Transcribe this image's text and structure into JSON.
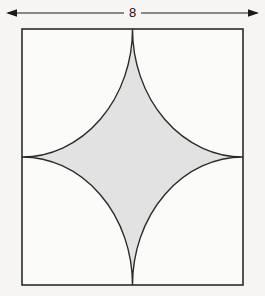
{
  "figure": {
    "background_color": "#f6f5f3",
    "dimension": {
      "label": "8",
      "orientation": "horizontal",
      "arrow_style": "double-headed",
      "line_color": "#1a1a1a",
      "x_start": 6,
      "x_end": 259,
      "y": 13
    },
    "square": {
      "name": "outer-square",
      "side_label": "8",
      "x": 22,
      "y": 29,
      "width": 221,
      "height": 256,
      "stroke_color": "#2b2b2b",
      "stroke_width": 1.6,
      "fill_color": "#fbfbfa"
    },
    "astroid": {
      "name": "astroid-star",
      "description": "Four-cusped star formed by four quarter-circle arcs centered at the square corners with radius equal to half the side",
      "fill_color": "#e2e2e2",
      "stroke_color": "#2b2b2b",
      "stroke_width": 1.4,
      "arc_radius": 110.5,
      "cusps": [
        {
          "name": "top-cusp",
          "x": 132.5,
          "y": 29
        },
        {
          "name": "right-cusp",
          "x": 243,
          "y": 157
        },
        {
          "name": "bottom-cusp",
          "x": 132.5,
          "y": 285
        },
        {
          "name": "left-cusp",
          "x": 22,
          "y": 157
        }
      ]
    }
  },
  "chart_data": {
    "type": "diagram",
    "labels": [
      "8"
    ],
    "annotations": [
      {
        "text": "8",
        "role": "side-length-dimension",
        "position": "top"
      }
    ],
    "shapes": [
      {
        "kind": "square",
        "side": 8,
        "units": "unlabeled",
        "area": 64
      },
      {
        "kind": "astroid",
        "construction": "four quarter circles of radius 4 centered at each corner of the square",
        "arc_radius": 4,
        "shaded": true,
        "fill": "#e2e2e2"
      }
    ]
  }
}
